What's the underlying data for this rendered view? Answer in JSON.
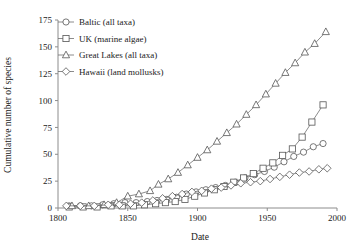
{
  "chart_data": {
    "type": "line",
    "title": "",
    "xlabel": "Date",
    "ylabel": "Cumulative number of species",
    "xlim": [
      1800,
      2000
    ],
    "ylim": [
      0,
      175
    ],
    "xticks": [
      1800,
      1850,
      1900,
      1950,
      2000
    ],
    "yticks": [
      0,
      25,
      50,
      75,
      100,
      125,
      150,
      175
    ],
    "xtick_labels": [
      "1800",
      "1850",
      "1900",
      "1950",
      "2000"
    ],
    "ytick_labels": [
      "0",
      "25",
      "50",
      "75",
      "100",
      "125",
      "150",
      "175"
    ],
    "grid": false,
    "legend_position": "top-left-inside",
    "series": [
      {
        "name": "Baltic (all taxa)",
        "marker": "circle",
        "points": [
          [
            1808,
            2
          ],
          [
            1816,
            2
          ],
          [
            1824,
            2
          ],
          [
            1832,
            3
          ],
          [
            1840,
            4
          ],
          [
            1848,
            5
          ],
          [
            1856,
            5
          ],
          [
            1864,
            6
          ],
          [
            1871,
            7
          ],
          [
            1878,
            8
          ],
          [
            1885,
            10
          ],
          [
            1892,
            13
          ],
          [
            1899,
            15
          ],
          [
            1906,
            17
          ],
          [
            1913,
            19
          ],
          [
            1920,
            21
          ],
          [
            1927,
            24
          ],
          [
            1934,
            28
          ],
          [
            1941,
            31
          ],
          [
            1948,
            34
          ],
          [
            1955,
            38
          ],
          [
            1962,
            43
          ],
          [
            1969,
            48
          ],
          [
            1976,
            52
          ],
          [
            1983,
            57
          ],
          [
            1990,
            60
          ]
        ]
      },
      {
        "name": "UK (marine algae)",
        "marker": "square",
        "points": [
          [
            1808,
            1
          ],
          [
            1818,
            1
          ],
          [
            1828,
            1
          ],
          [
            1838,
            2
          ],
          [
            1846,
            2
          ],
          [
            1854,
            2
          ],
          [
            1862,
            3
          ],
          [
            1870,
            4
          ],
          [
            1877,
            5
          ],
          [
            1884,
            6
          ],
          [
            1891,
            8
          ],
          [
            1898,
            11
          ],
          [
            1905,
            14
          ],
          [
            1912,
            17
          ],
          [
            1919,
            20
          ],
          [
            1926,
            24
          ],
          [
            1933,
            28
          ],
          [
            1940,
            32
          ],
          [
            1947,
            37
          ],
          [
            1954,
            42
          ],
          [
            1961,
            49
          ],
          [
            1968,
            55
          ],
          [
            1975,
            66
          ],
          [
            1982,
            80
          ],
          [
            1990,
            96
          ]
        ]
      },
      {
        "name": "Great Lakes (all taxa)",
        "marker": "triangle",
        "points": [
          [
            1810,
            2
          ],
          [
            1822,
            2
          ],
          [
            1833,
            3
          ],
          [
            1842,
            5
          ],
          [
            1850,
            11
          ],
          [
            1858,
            13
          ],
          [
            1866,
            16
          ],
          [
            1872,
            22
          ],
          [
            1879,
            27
          ],
          [
            1886,
            33
          ],
          [
            1893,
            40
          ],
          [
            1900,
            47
          ],
          [
            1907,
            54
          ],
          [
            1914,
            62
          ],
          [
            1921,
            70
          ],
          [
            1928,
            78
          ],
          [
            1935,
            87
          ],
          [
            1942,
            96
          ],
          [
            1949,
            106
          ],
          [
            1956,
            116
          ],
          [
            1963,
            126
          ],
          [
            1970,
            135
          ],
          [
            1977,
            145
          ],
          [
            1984,
            153
          ],
          [
            1992,
            164
          ]
        ]
      },
      {
        "name": "Hawaii (land mollusks)",
        "marker": "diamond",
        "points": [
          [
            1806,
            2
          ],
          [
            1816,
            2
          ],
          [
            1826,
            2
          ],
          [
            1836,
            3
          ],
          [
            1844,
            3
          ],
          [
            1852,
            4
          ],
          [
            1860,
            5
          ],
          [
            1868,
            7
          ],
          [
            1875,
            9
          ],
          [
            1882,
            11
          ],
          [
            1889,
            13
          ],
          [
            1896,
            15
          ],
          [
            1903,
            16
          ],
          [
            1910,
            18
          ],
          [
            1917,
            19
          ],
          [
            1924,
            21
          ],
          [
            1931,
            23
          ],
          [
            1938,
            24
          ],
          [
            1945,
            25
          ],
          [
            1952,
            27
          ],
          [
            1959,
            29
          ],
          [
            1966,
            31
          ],
          [
            1973,
            33
          ],
          [
            1980,
            34
          ],
          [
            1987,
            36
          ],
          [
            1993,
            37
          ]
        ]
      }
    ],
    "legend_entries": [
      {
        "label": "Baltic (all taxa)",
        "marker": "circle"
      },
      {
        "label": "UK (marine algae)",
        "marker": "square"
      },
      {
        "label": "Great Lakes (all taxa)",
        "marker": "triangle"
      },
      {
        "label": "Hawaii (land mollusks)",
        "marker": "diamond"
      }
    ]
  },
  "colors": {
    "line": "#6e6e6e",
    "marker_stroke": "#555555",
    "marker_fill": "#ffffff",
    "axis": "#8c8c8c",
    "text": "#1a1a1a",
    "background": "#ffffff"
  }
}
